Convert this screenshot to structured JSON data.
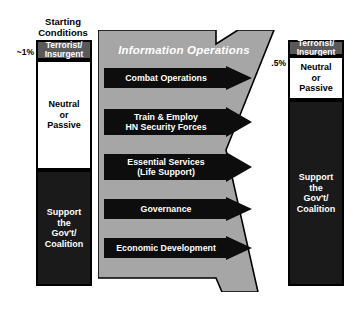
{
  "diagram": {
    "title_left": "Starting\nConditions",
    "left_column": {
      "percent_label": "~1%",
      "blocks": [
        {
          "label": "Terrorist/\nInsurgent",
          "style": "terrorist"
        },
        {
          "label": "Neutral\nor\nPassive",
          "style": "neutral"
        },
        {
          "label": "Support\nthe\nGov't/\nCoalition",
          "style": "support"
        }
      ]
    },
    "right_column": {
      "percent_label": ".5%",
      "blocks": [
        {
          "label": "Terrorist/\nInsurgent",
          "style": "terrorist"
        },
        {
          "label": "Neutral\nor\nPassive",
          "style": "neutral"
        },
        {
          "label": "Support\nthe\nGov't/\nCoalition",
          "style": "support"
        }
      ]
    },
    "center": {
      "title": "Information Operations",
      "lines_of_effort": [
        {
          "label": "Combat Operations"
        },
        {
          "label": "Train & Employ\nHN Security Forces"
        },
        {
          "label": "Essential Services\n(Life Support)"
        },
        {
          "label": "Governance"
        },
        {
          "label": "Economic Development"
        }
      ]
    },
    "colors": {
      "gray_arrow": "#a6a6a6",
      "black_arrow": "#0d0d0d",
      "terrorist_block": "#595959",
      "support_block": "#1a1a1a",
      "neutral_block": "#ffffff",
      "outline": "#000000",
      "text_light": "#ffffff",
      "text_dark": "#000000"
    }
  }
}
